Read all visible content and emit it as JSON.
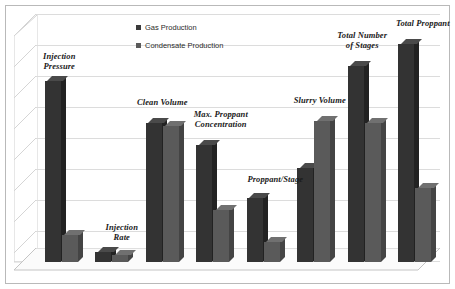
{
  "chart_data": {
    "type": "bar",
    "title": "",
    "subtitle": "",
    "xlabel": "",
    "ylabel": "",
    "grid": true,
    "gridline_count": 8,
    "legend_position": "top-center",
    "ylim": [
      0,
      100
    ],
    "categories": [
      "Injection\nPressure",
      "Injection\nRate",
      "Clean Volume",
      "Max. Proppant\nConcentration",
      "Proppant/Stage",
      "Slurry Volume",
      "Total Number\nof Stages",
      "Total Proppant"
    ],
    "series": [
      {
        "name": "Gas Production",
        "color": "#333333",
        "values": [
          73,
          4,
          56,
          47,
          26,
          38,
          79,
          88
        ]
      },
      {
        "name": "Condensate Production",
        "color": "#5a5a5a",
        "values": [
          11,
          3,
          55,
          21,
          8,
          57,
          56,
          30
        ]
      }
    ],
    "annotations": []
  },
  "legend": {
    "items": [
      {
        "label": "Gas Production",
        "swatch": "series-a-swatch",
        "color": "#3a3a3a"
      },
      {
        "label": "Condensate Production",
        "swatch": "series-b-swatch",
        "color": "#5a5a5a"
      }
    ]
  },
  "colors": {
    "series_a": "#333333",
    "series_b": "#5a5a5a",
    "gridline": "#dcdcdc",
    "frame": "#b9b9b9",
    "background": "#ffffff",
    "label_text": "#1a1a1a"
  }
}
